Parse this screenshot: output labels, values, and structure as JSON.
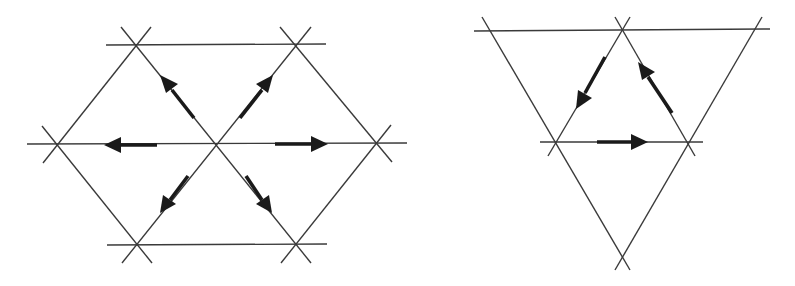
{
  "figure": {
    "colors": {
      "background": "#ffffff",
      "line": "#3a3a3a",
      "arrow": "#1a1a1a"
    },
    "panels": [
      {
        "id": "left",
        "description": "Hexagonal star arrangement: three crossing line families forming a hexagon with six arrows radiating outward from the central vertex",
        "arrows": [
          {
            "direction": "up-left",
            "from": [
              195,
              118
            ],
            "to": [
              160,
              75
            ]
          },
          {
            "direction": "up-right",
            "from": [
              238,
              118
            ],
            "to": [
              273,
              75
            ]
          },
          {
            "direction": "left",
            "from": [
              157,
              145
            ],
            "to": [
              104,
              145
            ]
          },
          {
            "direction": "right",
            "from": [
              275,
              144
            ],
            "to": [
              328,
              144
            ]
          },
          {
            "direction": "down-left",
            "from": [
              188,
              176
            ],
            "to": [
              160,
              213
            ]
          },
          {
            "direction": "down-right",
            "from": [
              246,
              176
            ],
            "to": [
              272,
              213
            ]
          }
        ]
      },
      {
        "id": "right",
        "description": "Inverted triangle arrangement with an inner triangle and three arrows circulating around it",
        "arrows": [
          {
            "direction": "down-left",
            "from": [
              605,
              57
            ],
            "to": [
              576,
              109
            ]
          },
          {
            "direction": "right",
            "from": [
              597,
              142
            ],
            "to": [
              647,
              142
            ]
          },
          {
            "direction": "up-left",
            "from": [
              672,
              113
            ],
            "to": [
              638,
              62
            ]
          }
        ]
      }
    ]
  }
}
